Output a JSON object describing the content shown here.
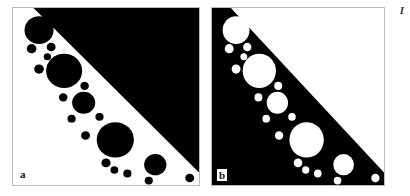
{
  "figure": {
    "caption_mark": "I",
    "background_color": "#ffffff",
    "panels": [
      {
        "id": "a",
        "label": "a",
        "role": "positive",
        "field_color": "#000000",
        "disk_color": "#000000",
        "ground_color": "#ffffff",
        "border_color": "#b9b9b9"
      },
      {
        "id": "b",
        "label": "b",
        "role": "negative",
        "field_color": "#ffffff",
        "disk_color": "#ffffff",
        "ground_color": "#000000",
        "border_color": "#b9b9b9"
      }
    ]
  },
  "chart_data": {
    "type": "scatter",
    "title": "",
    "subtitle": "",
    "xlabel": "",
    "ylabel": "",
    "xlim": [
      0,
      100
    ],
    "ylim": [
      0,
      100
    ],
    "grid": false,
    "legend": null,
    "annotations": [
      "a",
      "b",
      "I"
    ],
    "diagonal_edge": {
      "start": [
        11,
        0
      ],
      "end": [
        100,
        93
      ],
      "units": "percent-of-panel"
    },
    "series": [
      {
        "name": "disks",
        "units": "percent-of-panel",
        "points": [
          {
            "cx": 14.0,
            "cy": 12.5,
            "r": 7.8
          },
          {
            "cx": 10.0,
            "cy": 23.0,
            "r": 2.6
          },
          {
            "cx": 20.5,
            "cy": 22.0,
            "r": 2.4
          },
          {
            "cx": 18.5,
            "cy": 27.5,
            "r": 2.0
          },
          {
            "cx": 14.0,
            "cy": 34.5,
            "r": 2.6
          },
          {
            "cx": 27.5,
            "cy": 35.5,
            "r": 9.7
          },
          {
            "cx": 38.5,
            "cy": 44.0,
            "r": 2.3
          },
          {
            "cx": 27.0,
            "cy": 50.5,
            "r": 2.3
          },
          {
            "cx": 38.0,
            "cy": 53.5,
            "r": 6.2
          },
          {
            "cx": 31.5,
            "cy": 62.5,
            "r": 2.2
          },
          {
            "cx": 46.5,
            "cy": 61.5,
            "r": 2.2
          },
          {
            "cx": 39.0,
            "cy": 72.0,
            "r": 2.4
          },
          {
            "cx": 55.0,
            "cy": 74.5,
            "r": 10.0
          },
          {
            "cx": 50.0,
            "cy": 87.5,
            "r": 2.5
          },
          {
            "cx": 54.5,
            "cy": 91.5,
            "r": 2.1
          },
          {
            "cx": 61.5,
            "cy": 93.5,
            "r": 2.2
          },
          {
            "cx": 76.5,
            "cy": 88.5,
            "r": 6.0
          },
          {
            "cx": 73.0,
            "cy": 97.5,
            "r": 2.2
          },
          {
            "cx": 95.0,
            "cy": 96.0,
            "r": 2.4
          }
        ]
      }
    ]
  }
}
